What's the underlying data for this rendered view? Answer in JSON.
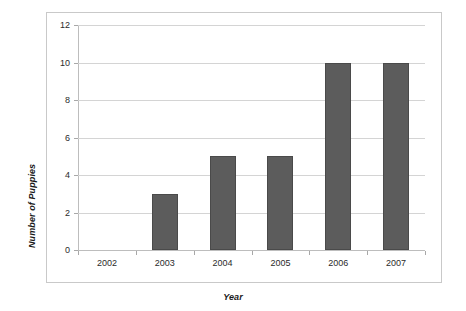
{
  "chart_data": {
    "type": "bar",
    "title": "",
    "xlabel": "Year",
    "ylabel": "Number of Puppies",
    "categories": [
      "2002",
      "2003",
      "2004",
      "2005",
      "2006",
      "2007"
    ],
    "values": [
      0,
      3,
      5,
      5,
      10,
      10
    ],
    "ylim": [
      0,
      12
    ],
    "yticks": [
      0,
      2,
      4,
      6,
      8,
      10,
      12
    ],
    "ytick_labels": [
      "0",
      "2",
      "4",
      "6",
      "8",
      "10",
      "12"
    ],
    "grid": true,
    "grid_axis": "y",
    "legend": false,
    "legend_position": "none",
    "series": [
      {
        "name": "Number of Puppies",
        "values": [
          0,
          3,
          5,
          5,
          10,
          10
        ],
        "color": "#5c5c5c"
      }
    ]
  },
  "style": {
    "bar_fill": "#5c5c5c",
    "bar_border": "#4a4a4a",
    "gridline_color": "#d4d4d4",
    "axis_color": "#bdbdbd",
    "frame_border": "#c9c9c9",
    "text_color": "#2b2b2b",
    "background": "#ffffff"
  }
}
